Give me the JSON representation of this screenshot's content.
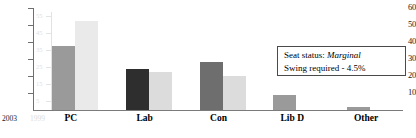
{
  "chart_data": {
    "type": "bar",
    "title": "",
    "xlabel": "",
    "ylabel": "",
    "ylim": [
      0,
      60
    ],
    "yticks": [
      0,
      10,
      20,
      30,
      40,
      50,
      60
    ],
    "ytick_labels": [
      "",
      "10",
      "20",
      "30",
      "40",
      "50",
      "60"
    ],
    "ghost_ytick_labels": [
      "5",
      "15",
      "25",
      "35",
      "45",
      "55"
    ],
    "ghost_yticks": [
      5,
      15,
      25,
      35,
      45,
      55
    ],
    "grid": false,
    "legend_position": "axis-inline",
    "categories": [
      "PC",
      "Lab",
      "Con",
      "Lib D",
      "Other"
    ],
    "series": [
      {
        "name": "2003",
        "color": "#9a9a9a",
        "values": [
          37.5,
          24.0,
          28.5,
          9.0,
          1.5
        ],
        "bar_colors": [
          "#9a9a9a",
          "#2e2e2e",
          "#6e6e6e",
          "#9a9a9a",
          "#9a9a9a"
        ]
      },
      {
        "name": "1999",
        "color": "#e2e2e2",
        "values": [
          52.5,
          22.5,
          20.0,
          0.0,
          0.0
        ],
        "bar_colors": [
          "#eaeaea",
          "#dcdcdc",
          "#dcdcdc",
          "#ffffff",
          "#ffffff"
        ]
      }
    ]
  },
  "axis": {
    "series_key_2003": "2003",
    "series_key_1999": "1999"
  },
  "annotation": {
    "seat_status_label": "Seat status:",
    "seat_status_value": "Marginal",
    "swing_text": "Swing required - 4.5%"
  }
}
